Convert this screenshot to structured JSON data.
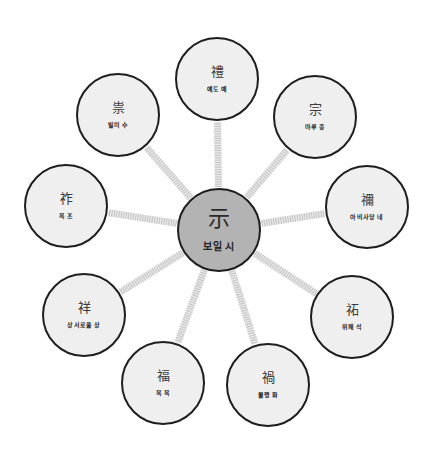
{
  "diagram": {
    "type": "radial-mind-map",
    "colors": {
      "center_fill": "#b3b3b3",
      "node_fill": "#efefef",
      "node_border": "#1e1e1e",
      "connector": "#c4c4c4"
    },
    "center": {
      "hanja": "示",
      "reading": "보일 시",
      "x": 219,
      "y": 230,
      "r": 42
    },
    "nodes": [
      {
        "hanja": "禮",
        "reading": "예도 예",
        "x": 217,
        "y": 79,
        "r": 42
      },
      {
        "hanja": "宗",
        "reading": "마루 종",
        "x": 315,
        "y": 117,
        "r": 42
      },
      {
        "hanja": "禰",
        "reading": "아비사당 네",
        "x": 367,
        "y": 207,
        "r": 42
      },
      {
        "hanja": "祏",
        "reading": "위패 석",
        "x": 352,
        "y": 317,
        "r": 42
      },
      {
        "hanja": "禍",
        "reading": "불행 화",
        "x": 268,
        "y": 385,
        "r": 42
      },
      {
        "hanja": "福",
        "reading": "복 복",
        "x": 163,
        "y": 383,
        "r": 42
      },
      {
        "hanja": "祥",
        "reading": "상서로울 상",
        "x": 84,
        "y": 315,
        "r": 42
      },
      {
        "hanja": "祚",
        "reading": "복 조",
        "x": 66,
        "y": 206,
        "r": 42
      },
      {
        "hanja": "祟",
        "reading": "빌미 수",
        "x": 118,
        "y": 115,
        "r": 42
      }
    ]
  }
}
